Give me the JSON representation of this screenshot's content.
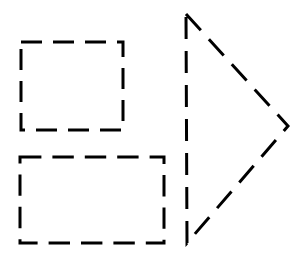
{
  "canvas": {
    "width": 295,
    "height": 260,
    "background_color": "#ffffff",
    "title": "Dashed geometric shapes"
  },
  "style": {
    "stroke_color": "#000000",
    "stroke_width": 3,
    "dash_length": 20,
    "gap_length": 10,
    "dash_array": "20 10",
    "fill": "none"
  },
  "shapes": [
    {
      "id": "square",
      "name": "dashed-square",
      "type": "rect",
      "x": 21,
      "y": 42,
      "width": 102,
      "height": 88,
      "stroke_color": "#000000",
      "stroke_width": 3,
      "dash_array": "21 11",
      "dash_offset": 0,
      "fill": "none"
    },
    {
      "id": "rectangle",
      "name": "dashed-rectangle",
      "type": "rect",
      "x": 20,
      "y": 157,
      "width": 144,
      "height": 86,
      "stroke_color": "#000000",
      "stroke_width": 3,
      "dash_array": "21.4 11",
      "dash_offset": 0,
      "fill": "none"
    },
    {
      "id": "triangle",
      "name": "dashed-triangle-right",
      "type": "polygon",
      "points": "186,14 288,126 187,243",
      "vertices": [
        {
          "label": "top",
          "x": 186,
          "y": 14
        },
        {
          "label": "right-tip",
          "x": 288,
          "y": 126
        },
        {
          "label": "bottom",
          "x": 187,
          "y": 243
        }
      ],
      "stroke_color": "#000000",
      "stroke_width": 3,
      "dash_array": "22 12",
      "dash_offset": 0,
      "fill": "none"
    }
  ]
}
